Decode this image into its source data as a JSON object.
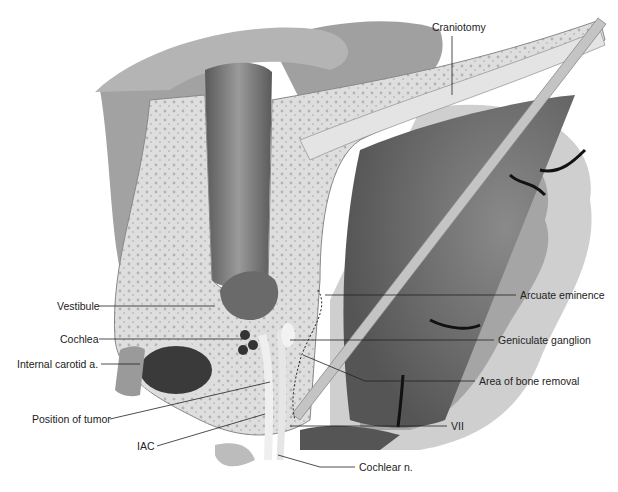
{
  "figure": {
    "type": "anatomical-illustration",
    "palette": {
      "background": "#ffffff",
      "muscle": "#9a9a9a",
      "bone": "#dcdcdc",
      "bone_pores": "#b5b5b5",
      "dura": "#7a7a7a",
      "brain_light": "#c8c8c8",
      "brain_dark": "#6e6e6e",
      "retractor": "#bdbdbd",
      "leader_line": "#222222"
    },
    "labels": {
      "craniotomy": "Craniotomy",
      "vestibule": "Vestibule",
      "cochlea": "Cochlea",
      "internal_carotid": "Internal carotid a.",
      "position_of_tumor": "Position of tumor",
      "iac": "IAC",
      "arcuate_eminence": "Arcuate eminence",
      "geniculate_ganglion": "Geniculate ganglion",
      "area_of_bone_removal": "Area of bone removal",
      "vii": "VII",
      "cochlear_n": "Cochlear n."
    }
  }
}
